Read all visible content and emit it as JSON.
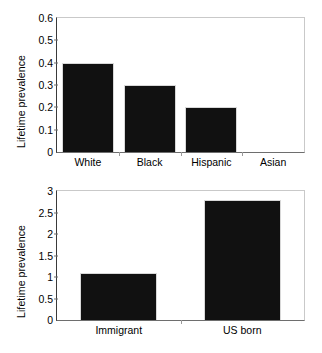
{
  "figure": {
    "background": "#ffffff",
    "bar_color": "#111111",
    "axis_color": "#6e6e6e"
  },
  "chart_data": [
    {
      "type": "bar",
      "panel": "top",
      "title": "",
      "xlabel": "",
      "ylabel": "Lifetime prevalence",
      "categories": [
        "White",
        "Black",
        "Hispanic",
        "Asian"
      ],
      "values": [
        0.4,
        0.3,
        0.2,
        0.0
      ],
      "ylim": [
        0,
        0.6
      ],
      "yticks": [
        0,
        0.1,
        0.2,
        0.3,
        0.4,
        0.5,
        0.6
      ],
      "ytick_labels": [
        "0",
        "0.1",
        "0.2",
        "0.3",
        "0.4",
        "0.5",
        "0.6"
      ],
      "grid": false,
      "legend": "none"
    },
    {
      "type": "bar",
      "panel": "bottom",
      "title": "",
      "xlabel": "",
      "ylabel": "Lifetime prevalence",
      "categories": [
        "Immigrant",
        "US born"
      ],
      "values": [
        1.1,
        2.8
      ],
      "ylim": [
        0,
        3
      ],
      "yticks": [
        0,
        0.5,
        1,
        1.5,
        2,
        2.5,
        3
      ],
      "ytick_labels": [
        "0",
        "0.5",
        "1",
        "1.5",
        "2",
        "2.5",
        "3"
      ],
      "grid": false,
      "legend": "none"
    }
  ]
}
